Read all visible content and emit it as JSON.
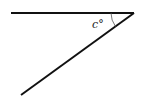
{
  "diagram": {
    "type": "angle",
    "angle_label": "c°",
    "stroke_color": "#111111",
    "rays": [
      {
        "name": "horizontal-ray",
        "from": [
          11,
          13
        ],
        "to": [
          134,
          13
        ]
      },
      {
        "name": "diagonal-ray",
        "from": [
          134,
          13
        ],
        "to": [
          21,
          95
        ]
      }
    ],
    "vertex": [
      134,
      13
    ]
  }
}
